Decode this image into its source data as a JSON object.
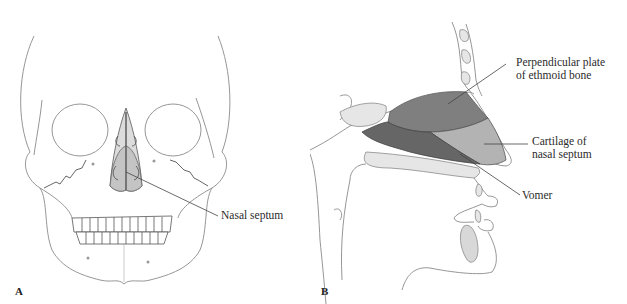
{
  "figure": {
    "type": "anatomical-diagram",
    "subject": "Nasal septum"
  },
  "panels": [
    {
      "id": "A",
      "letter": "A",
      "view": "anterior view of skull",
      "labels": [
        {
          "text": "Nasal septum"
        }
      ]
    },
    {
      "id": "B",
      "letter": "B",
      "view": "sagittal section of nasal cavity",
      "labels": [
        {
          "text_line1": "Perpendicular plate",
          "text_line2": "of ethmoid bone"
        },
        {
          "text_line1": "Cartilage of",
          "text_line2": "nasal septum"
        },
        {
          "text": "Vomer"
        }
      ]
    }
  ],
  "colors": {
    "outline": "#8a8a8a",
    "ethmoid_fill": "#7f7f7f",
    "vomer_fill": "#666666",
    "cartilage_fill": "#b3b3b3",
    "bone_light_fill": "#e6e6e6",
    "septum_front_fill": "#cfcfcf"
  }
}
